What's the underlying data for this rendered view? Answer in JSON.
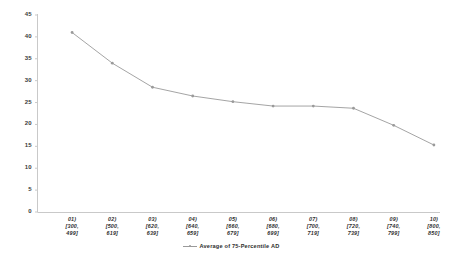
{
  "chart_data": {
    "type": "line",
    "title": "",
    "xlabel": "",
    "ylabel": "",
    "grid": false,
    "legend_position": "bottom",
    "ylim": [
      0,
      45
    ],
    "yticks": [
      0,
      5,
      10,
      15,
      20,
      25,
      30,
      35,
      40,
      45
    ],
    "ytick_labels": [
      "0",
      "5",
      "10",
      "15",
      "20",
      "25",
      "30",
      "35",
      "40",
      "45"
    ],
    "categories": [
      "01)\n[300,\n499]",
      "02)\n[500,\n619]",
      "03)\n[620,\n639]",
      "04)\n[640,\n659]",
      "05)\n[660,\n679]",
      "06)\n[680,\n699]",
      "07)\n[700,\n719]",
      "08)\n[720,\n739]",
      "09)\n[740,\n799]",
      "10)\n[800,\n850]"
    ],
    "category_lines": [
      [
        "01)",
        "[300,",
        "499]"
      ],
      [
        "02)",
        "[500,",
        "619]"
      ],
      [
        "03)",
        "[620,",
        "639]"
      ],
      [
        "04)",
        "[640,",
        "659]"
      ],
      [
        "05)",
        "[660,",
        "679]"
      ],
      [
        "06)",
        "[680,",
        "699]"
      ],
      [
        "07)",
        "[700,",
        "719]"
      ],
      [
        "08)",
        "[720,",
        "739]"
      ],
      [
        "09)",
        "[740,",
        "799]"
      ],
      [
        "10)",
        "[800,",
        "850]"
      ]
    ],
    "series": [
      {
        "name": "Average of 75-Percentile AD",
        "color": "#9a9a9a",
        "values": [
          41.0,
          34.0,
          28.5,
          26.5,
          25.2,
          24.2,
          24.2,
          23.7,
          19.8,
          15.3
        ]
      }
    ]
  },
  "legend": {
    "entries": [
      {
        "label": "Average of 75-Percentile AD",
        "color": "#9a9a9a"
      }
    ]
  },
  "axis": {
    "y_axis_color": "#c8c8c8",
    "x_axis_color": "#c8c8c8"
  }
}
